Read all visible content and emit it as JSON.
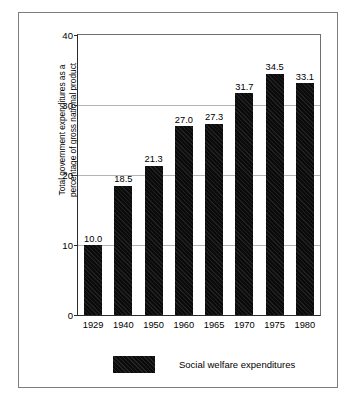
{
  "chart_data": {
    "type": "bar",
    "title": "",
    "subtitle": "",
    "xlabel": "",
    "ylabel": "Total government expenditures as a percentage of gross national product",
    "ylabel_lines": [
      "Total government expenditures as a",
      "percentage of gross national product"
    ],
    "categories": [
      "1929",
      "1940",
      "1950",
      "1960",
      "1965",
      "1970",
      "1975",
      "1980"
    ],
    "values": [
      10.0,
      18.5,
      21.3,
      27.0,
      27.3,
      31.7,
      34.5,
      33.1
    ],
    "value_labels": [
      "10.0",
      "18.5",
      "21.3",
      "27.0",
      "27.3",
      "31.7",
      "34.5",
      "33.1"
    ],
    "series": [
      {
        "name": "Social welfare expenditures",
        "values": [
          10.0,
          18.5,
          21.3,
          27.0,
          27.3,
          31.7,
          34.5,
          33.1
        ]
      }
    ],
    "ylim": [
      0,
      40
    ],
    "yticks": [
      0,
      10,
      20,
      30,
      40
    ],
    "ytick_labels": [
      "0",
      "10",
      "20",
      "30",
      "40"
    ],
    "grid": true,
    "grid_axis": "y",
    "legend_position": "bottom",
    "legend": [
      {
        "label": "Social welfare expenditures",
        "color": "#0b0b0b",
        "pattern": "diagonal-hatch"
      }
    ],
    "bar_color": "#0b0b0b",
    "gridline_color": "#b4b4b4",
    "axis_color": "#2b2b2b",
    "frame_color": "#7d7d7d",
    "background_color": "#ffffff"
  }
}
